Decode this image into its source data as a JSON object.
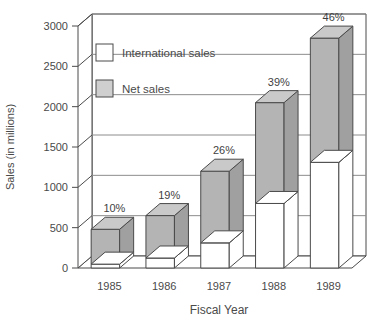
{
  "chart_data": {
    "type": "bar",
    "title": "",
    "subtitle": "",
    "xlabel": "Fiscal Year",
    "ylabel": "Sales (in millions)",
    "categories": [
      "1985",
      "1986",
      "1987",
      "1988",
      "1989"
    ],
    "ylim": [
      0,
      3000
    ],
    "yticks": [
      0,
      500,
      1000,
      1500,
      2000,
      2500,
      3000
    ],
    "ytick_labels": [
      "0",
      "500",
      "1000",
      "1500",
      "2000",
      "2500",
      "3000"
    ],
    "grid": true,
    "legend_position": "top-left",
    "stacked": true,
    "style": "3d-grayscale",
    "series": [
      {
        "name": "International sales",
        "color": "#ffffff",
        "values": [
          48,
          124,
          312,
          800,
          1310
        ]
      },
      {
        "name": "Net sales",
        "color": "#b4b4b4",
        "values": [
          480,
          650,
          1200,
          2050,
          2850
        ]
      }
    ],
    "annotations": [
      {
        "category": "1985",
        "text": "10%"
      },
      {
        "category": "1986",
        "text": "19%"
      },
      {
        "category": "1987",
        "text": "26%"
      },
      {
        "category": "1988",
        "text": "39%"
      },
      {
        "category": "1989",
        "text": "46%"
      }
    ]
  },
  "legend": {
    "items": [
      {
        "label": "International sales",
        "swatch": "white"
      },
      {
        "label": "Net sales",
        "swatch": "gray"
      }
    ]
  },
  "colors": {
    "bar_front_gray": "#b4b4b4",
    "bar_top_gray": "#c9c9c9",
    "bar_side_gray": "#a0a0a0",
    "bar_white": "#ffffff",
    "outline": "#4a4a4a",
    "grid": "#8c8c8c",
    "text": "#4a4a4a",
    "background": "#ffffff"
  }
}
